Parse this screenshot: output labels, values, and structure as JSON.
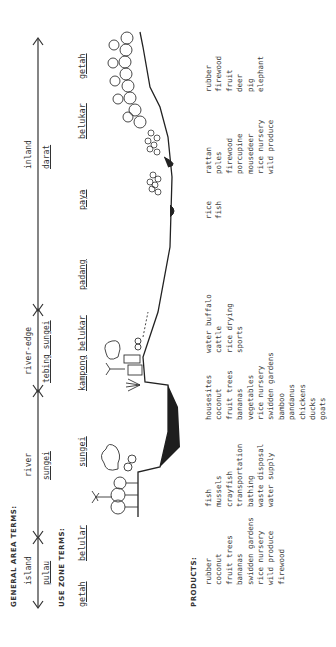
{
  "headers": {
    "general_area_terms": "GENERAL AREA TERMS:",
    "use_zone_terms": "USE ZONE TERMS:",
    "products": "PRODUCTS:"
  },
  "general_areas": [
    {
      "english": "island",
      "local": "pulau"
    },
    {
      "english": "river",
      "local": "sungei"
    },
    {
      "english": "river-edge",
      "local": "tebing sungei"
    },
    {
      "english": "inland",
      "local": "darat"
    }
  ],
  "use_zones": [
    {
      "name": "getah"
    },
    {
      "name": "belular"
    },
    {
      "name": "sungei"
    },
    {
      "name": "kampong"
    },
    {
      "name": "belukar"
    },
    {
      "name": "padang"
    },
    {
      "name": "paya"
    },
    {
      "name": "belukar"
    },
    {
      "name": "getah"
    }
  ],
  "product_columns": [
    {
      "zone": "getah/belular",
      "items": [
        "rubber",
        "coconut",
        "fruit trees",
        "bananas",
        "swidden gardens",
        "rice nursery",
        "wild produce",
        "firewood"
      ]
    },
    {
      "zone": "sungei",
      "items": [
        "fish",
        "mussels",
        "crayfish",
        "transportation",
        "bathing",
        "waste disposal",
        "water supply"
      ]
    },
    {
      "zone": "kampong/belukar",
      "items": [
        "housesites",
        "coconut",
        "fruit trees",
        "bananas",
        "vegetables",
        "rice nursery",
        "swidden gardens",
        "bamboo",
        "pandanus",
        "chickens",
        "ducks",
        "goats"
      ]
    },
    {
      "zone": "padang",
      "items": [
        "water buffalo",
        "cattle",
        "rice drying",
        "sports"
      ]
    },
    {
      "zone": "paya",
      "items": [
        "rice",
        "fish"
      ]
    },
    {
      "zone": "belukar",
      "items": [
        "rattan",
        "poles",
        "firewood",
        "porcupine",
        "mousedeer",
        "rice nursery",
        "wild produce"
      ]
    },
    {
      "zone": "getah",
      "items": [
        "rubber",
        "firewood",
        "fruit",
        "deer",
        "pig",
        "elephant"
      ]
    }
  ],
  "colors": {
    "ink": "#2a2a2a",
    "paper": "#ffffff"
  }
}
